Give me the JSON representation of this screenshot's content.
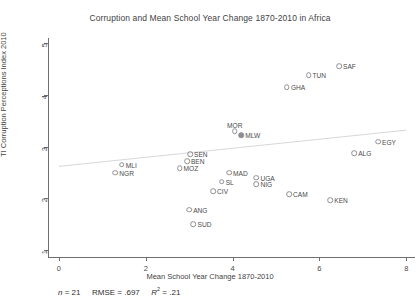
{
  "chart_data": {
    "type": "scatter",
    "title": "Corruption and Mean School Year Change 1870-2010 in Africa",
    "xlabel": "Mean School Year Change 1870-2010",
    "ylabel": "TI Corruption Perceptions Index 2010",
    "xlim": [
      -0.25,
      8.2
    ],
    "ylim": [
      0.85,
      5.1
    ],
    "xticks": [
      0,
      2,
      4,
      6,
      8
    ],
    "yticks": [
      1,
      2,
      3,
      4,
      5
    ],
    "xtick_labels": [
      "0",
      "2",
      "4",
      "6",
      "8"
    ],
    "ytick_labels": [
      "1",
      "2",
      "3",
      "4",
      "5"
    ],
    "grid": false,
    "legend": null,
    "marker": "open-circle",
    "fit_line": {
      "visible": true,
      "x": [
        0.0,
        8.0
      ],
      "y": [
        2.62,
        3.32
      ]
    },
    "points": [
      {
        "label": "SAF",
        "x": 6.45,
        "y": 4.55,
        "label_pos": "right",
        "filled": false
      },
      {
        "label": "TUN",
        "x": 5.75,
        "y": 4.38,
        "label_pos": "right",
        "filled": false
      },
      {
        "label": "GHA",
        "x": 5.25,
        "y": 4.15,
        "label_pos": "right",
        "filled": false
      },
      {
        "label": "MOR",
        "x": 4.05,
        "y": 3.3,
        "label_pos": "above",
        "filled": false
      },
      {
        "label": "MLW",
        "x": 4.2,
        "y": 3.22,
        "label_pos": "right",
        "filled": true
      },
      {
        "label": "EGY",
        "x": 7.35,
        "y": 3.1,
        "label_pos": "right",
        "filled": false
      },
      {
        "label": "ALG",
        "x": 6.8,
        "y": 2.88,
        "label_pos": "right",
        "filled": false
      },
      {
        "label": "SEN",
        "x": 3.02,
        "y": 2.85,
        "label_pos": "right",
        "filled": false
      },
      {
        "label": "BEN",
        "x": 2.95,
        "y": 2.72,
        "label_pos": "right",
        "filled": false
      },
      {
        "label": "MOZ",
        "x": 2.78,
        "y": 2.58,
        "label_pos": "right",
        "filled": false
      },
      {
        "label": "MLI",
        "x": 1.45,
        "y": 2.65,
        "label_pos": "right",
        "filled": false
      },
      {
        "label": "NGR",
        "x": 1.3,
        "y": 2.5,
        "label_pos": "right",
        "filled": false
      },
      {
        "label": "MAD",
        "x": 3.92,
        "y": 2.5,
        "label_pos": "right",
        "filled": false
      },
      {
        "label": "UGA",
        "x": 4.55,
        "y": 2.4,
        "label_pos": "right",
        "filled": false
      },
      {
        "label": "SL",
        "x": 3.75,
        "y": 2.32,
        "label_pos": "right",
        "filled": false
      },
      {
        "label": "NIG",
        "x": 4.55,
        "y": 2.28,
        "label_pos": "right",
        "filled": false
      },
      {
        "label": "CIV",
        "x": 3.55,
        "y": 2.14,
        "label_pos": "right",
        "filled": false
      },
      {
        "label": "CAM",
        "x": 5.3,
        "y": 2.08,
        "label_pos": "right",
        "filled": false
      },
      {
        "label": "KEN",
        "x": 6.25,
        "y": 1.97,
        "label_pos": "right",
        "filled": false
      },
      {
        "label": "ANG",
        "x": 3.0,
        "y": 1.78,
        "label_pos": "right",
        "filled": false
      },
      {
        "label": "SUD",
        "x": 3.1,
        "y": 1.5,
        "label_pos": "right",
        "filled": false
      }
    ]
  },
  "footer": {
    "n_label": "n",
    "n_value": "= 21",
    "rmse_label": "RMSE",
    "rmse_value": "=  .697",
    "r2_label": "R",
    "r2_exp": "2",
    "r2_value": "= .21"
  }
}
